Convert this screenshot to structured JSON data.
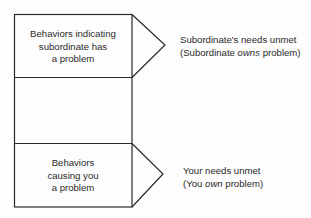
{
  "diagram": {
    "top_box": {
      "lines": [
        "Behaviors indicating",
        "subordinate has",
        "a problem"
      ]
    },
    "middle_box": {
      "lines": []
    },
    "bottom_box": {
      "lines": [
        "Behaviors",
        "causing you",
        "a problem"
      ]
    },
    "top_outcome": {
      "line1": "Subordinate's needs unmet",
      "line2_pre": "(Subordinate ",
      "line2_em": "owns",
      "line2_post": " problem)"
    },
    "bottom_outcome": {
      "line1": "Your needs unmet",
      "line2_pre": "(You ",
      "line2_em": "own",
      "line2_post": " problem)"
    },
    "colors": {
      "line": "#2a2a2a",
      "background": "#fdfdfd"
    }
  }
}
